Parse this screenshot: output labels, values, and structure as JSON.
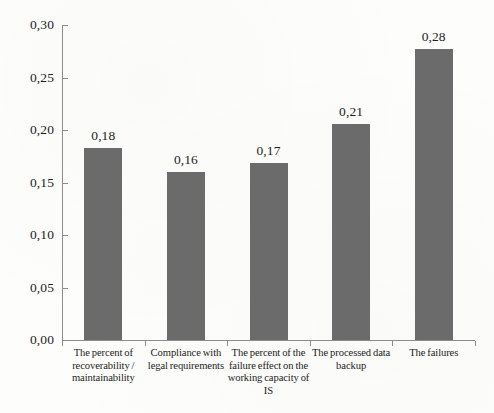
{
  "chart_data": {
    "type": "bar",
    "title": "",
    "subtitle": "",
    "xlabel": "",
    "ylabel": "",
    "ylim": [
      0.0,
      0.3
    ],
    "ytick_step": 0.05,
    "decimal_separator": ",",
    "grid": false,
    "legend": false,
    "bar_color": "#6b6b6b",
    "axis_color": "#8d8d8d",
    "background_color": "#fdfdfb",
    "ytick_labels": [
      "0,30",
      "0,25",
      "0,20",
      "0,15",
      "0,10",
      "0,05",
      "0,00"
    ],
    "ytick_values": [
      0.3,
      0.25,
      0.2,
      0.15,
      0.1,
      0.05,
      0.0
    ],
    "categories": [
      "The percent of recoverability / maintainability",
      "Compliance with legal requirements",
      "The percent of the failure effect on the working capacity of IS",
      "The processed data backup",
      "The failures"
    ],
    "category_lines": [
      [
        "The percent of",
        "recoverability /",
        "maintainability"
      ],
      [
        "Compliance with",
        "legal requirements"
      ],
      [
        "The percent of the",
        "failure effect on the",
        "working capacity of",
        "IS"
      ],
      [
        "The processed data",
        "backup"
      ],
      [
        "The failures"
      ]
    ],
    "values": [
      0.183,
      0.16,
      0.169,
      0.206,
      0.277
    ],
    "value_labels": [
      "0,18",
      "0,16",
      "0,17",
      "0,21",
      "0,28"
    ]
  }
}
